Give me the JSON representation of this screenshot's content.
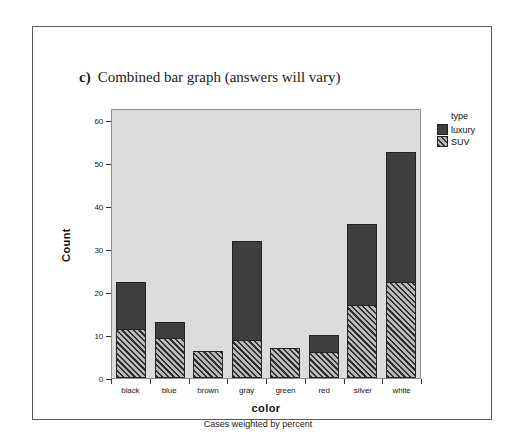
{
  "caption": {
    "letter": "c)",
    "text": "Combined bar graph (answers will vary)"
  },
  "footnote": "Cases weighted by percent",
  "legend": {
    "title": "type",
    "items": [
      {
        "label": "luxury",
        "color": "#3f3f3f",
        "pattern": "solid"
      },
      {
        "label": "SUV",
        "color": "#5a5a5a",
        "pattern": "diagonal-hatch"
      }
    ]
  },
  "chart_data": {
    "type": "bar",
    "stacked": true,
    "title": "",
    "xlabel": "color",
    "ylabel": "Count",
    "ylim": [
      0,
      63
    ],
    "yticks": [
      0,
      10,
      20,
      30,
      40,
      50,
      60
    ],
    "ytick_labels": [
      "0",
      "10",
      "20",
      "30",
      "40",
      "50",
      "60"
    ],
    "grid": false,
    "legend_position": "right",
    "categories": [
      "black",
      "blue",
      "brown",
      "gray",
      "green",
      "red",
      "silver",
      "white"
    ],
    "series": [
      {
        "name": "SUV",
        "values": [
          11.5,
          9.3,
          6.4,
          8.8,
          7.1,
          6.0,
          17.0,
          22.3
        ]
      },
      {
        "name": "luxury",
        "values": [
          11.0,
          3.7,
          0.0,
          23.2,
          0.0,
          4.1,
          19.0,
          30.4
        ]
      }
    ],
    "totals": [
      22.5,
      13.0,
      6.4,
      32.0,
      7.1,
      10.1,
      36.0,
      52.7
    ],
    "plot_background": "#dcdcdc",
    "footnote": "Cases weighted by percent"
  }
}
